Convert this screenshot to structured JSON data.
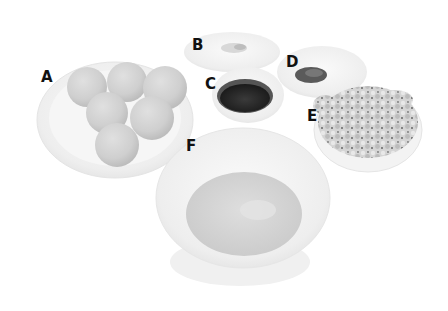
{
  "image": {
    "description": "Grayscale photo of six ingredient bowls labeled A through F",
    "labels": [
      {
        "id": "A",
        "text": "A",
        "x": 41,
        "y": 70,
        "item": "plate of round dough balls"
      },
      {
        "id": "B",
        "text": "B",
        "x": 192,
        "y": 38,
        "item": "small dish with white crumbly topping"
      },
      {
        "id": "C",
        "text": "C",
        "x": 205,
        "y": 77,
        "item": "small bowl of dark liquid sauce"
      },
      {
        "id": "D",
        "text": "D",
        "x": 286,
        "y": 55,
        "item": "small dish with dark ground spice"
      },
      {
        "id": "E",
        "text": "E",
        "x": 307,
        "y": 109,
        "item": "bowl of crumbled pieces"
      },
      {
        "id": "F",
        "text": "F",
        "x": 186,
        "y": 139,
        "item": "large bowl of mashed filling"
      }
    ]
  }
}
